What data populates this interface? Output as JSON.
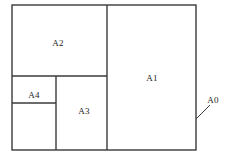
{
  "figure": {
    "type": "partition-diagram",
    "background_color": "#ffffff",
    "stroke_color": "#3a3a3a",
    "text_color": "#1a1a1a",
    "canvas": {
      "width": 235,
      "height": 165
    }
  },
  "outer_rect": {
    "name": "A0",
    "x": 12,
    "y": 5,
    "width": 184,
    "height": 145
  },
  "regions": [
    {
      "id": "A1",
      "label": "A1",
      "x": 107,
      "y": 5,
      "width": 89,
      "height": 145,
      "label_x": 152,
      "label_y": 78
    },
    {
      "id": "A2",
      "label": "A2",
      "x": 12,
      "y": 5,
      "width": 95,
      "height": 71,
      "label_x": 58,
      "label_y": 43
    },
    {
      "id": "A3",
      "label": "A3",
      "x": 56,
      "y": 76,
      "width": 51,
      "height": 74,
      "label_x": 84,
      "label_y": 111
    },
    {
      "id": "A4",
      "label": "A4",
      "x": 12,
      "y": 76,
      "width": 44,
      "height": 27,
      "label_x": 34,
      "label_y": 95
    },
    {
      "id": "A5",
      "label": "",
      "x": 12,
      "y": 103,
      "width": 44,
      "height": 47,
      "label_x": 34,
      "label_y": 127
    }
  ],
  "dividers": [
    {
      "id": "vertical-main",
      "x1": 107,
      "y1": 5,
      "x2": 107,
      "y2": 150
    },
    {
      "id": "horizontal-a2-bottom",
      "x1": 12,
      "y1": 76,
      "x2": 107,
      "y2": 76
    },
    {
      "id": "vertical-a4-a3",
      "x1": 56,
      "y1": 76,
      "x2": 56,
      "y2": 150
    },
    {
      "id": "horizontal-a4-bottom",
      "x1": 12,
      "y1": 103,
      "x2": 56,
      "y2": 103
    }
  ],
  "callout": {
    "label": "A0",
    "label_x": 213,
    "label_y": 100,
    "leader_x1": 196,
    "leader_y1": 119,
    "leader_x2": 210,
    "leader_y2": 105
  }
}
